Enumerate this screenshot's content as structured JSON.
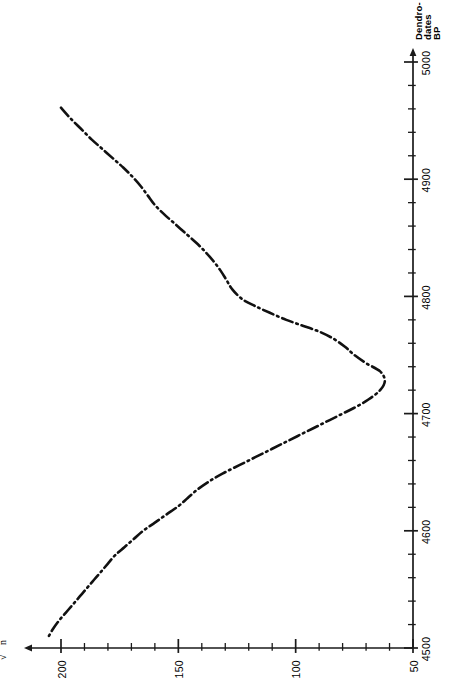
{
  "chart_data": {
    "type": "line",
    "title": "",
    "subtitle": "",
    "xlabel": "sqrt(sum sigma_i^2 / n)",
    "xlabel_display": "√(Σσᵢ²/n)",
    "ylabel": "Dendro-dates BP",
    "ylabel_lines": [
      "Dendro-",
      "dates",
      "BP"
    ],
    "x_axis": {
      "orientation": "horizontal",
      "direction": "reversed",
      "min": 50,
      "max": 210,
      "major_ticks": [
        200,
        150,
        100,
        50
      ],
      "major_tick_labels": [
        "200",
        "150",
        "100",
        "50"
      ],
      "minor_tick_step": 10,
      "arrow": "left",
      "grid": false
    },
    "y_axis": {
      "orientation": "vertical",
      "direction": "reversed-upward",
      "min": 4500,
      "max": 5030,
      "major_ticks": [
        4500,
        4600,
        4700,
        4800,
        4900,
        5000
      ],
      "major_tick_labels": [
        "4500",
        "4600",
        "4700",
        "4800",
        "4900",
        "5000"
      ],
      "minor_tick_step": 20,
      "arrow": "up",
      "grid": false
    },
    "series": [
      {
        "name": "standard deviation of calibration",
        "linestyle": "dash-dot",
        "color": "#111111",
        "linewidth": 2.6,
        "points": [
          {
            "x": 200.0,
            "y": 4961
          },
          {
            "x": 196.0,
            "y": 4952
          },
          {
            "x": 191.5,
            "y": 4943
          },
          {
            "x": 187.0,
            "y": 4934
          },
          {
            "x": 182.5,
            "y": 4926
          },
          {
            "x": 178.0,
            "y": 4918
          },
          {
            "x": 173.5,
            "y": 4910
          },
          {
            "x": 169.5,
            "y": 4902
          },
          {
            "x": 166.0,
            "y": 4894
          },
          {
            "x": 163.0,
            "y": 4886
          },
          {
            "x": 160.0,
            "y": 4878
          },
          {
            "x": 156.0,
            "y": 4870
          },
          {
            "x": 151.5,
            "y": 4862
          },
          {
            "x": 147.0,
            "y": 4854
          },
          {
            "x": 142.5,
            "y": 4846
          },
          {
            "x": 138.5,
            "y": 4838
          },
          {
            "x": 135.0,
            "y": 4830
          },
          {
            "x": 132.0,
            "y": 4822
          },
          {
            "x": 129.5,
            "y": 4814
          },
          {
            "x": 127.0,
            "y": 4806
          },
          {
            "x": 123.0,
            "y": 4798
          },
          {
            "x": 117.5,
            "y": 4792
          },
          {
            "x": 111.0,
            "y": 4786
          },
          {
            "x": 104.0,
            "y": 4780
          },
          {
            "x": 97.0,
            "y": 4775
          },
          {
            "x": 90.0,
            "y": 4770
          },
          {
            "x": 84.0,
            "y": 4764
          },
          {
            "x": 79.0,
            "y": 4757
          },
          {
            "x": 75.0,
            "y": 4750
          },
          {
            "x": 70.0,
            "y": 4743
          },
          {
            "x": 64.0,
            "y": 4736
          },
          {
            "x": 62.0,
            "y": 4728
          },
          {
            "x": 64.0,
            "y": 4720
          },
          {
            "x": 69.0,
            "y": 4712
          },
          {
            "x": 75.0,
            "y": 4705
          },
          {
            "x": 82.0,
            "y": 4698
          },
          {
            "x": 89.0,
            "y": 4691
          },
          {
            "x": 96.0,
            "y": 4684
          },
          {
            "x": 103.0,
            "y": 4677
          },
          {
            "x": 110.0,
            "y": 4670
          },
          {
            "x": 117.0,
            "y": 4663
          },
          {
            "x": 124.0,
            "y": 4656
          },
          {
            "x": 131.0,
            "y": 4649
          },
          {
            "x": 137.0,
            "y": 4642
          },
          {
            "x": 142.0,
            "y": 4635
          },
          {
            "x": 146.0,
            "y": 4628
          },
          {
            "x": 150.0,
            "y": 4621
          },
          {
            "x": 155.0,
            "y": 4614
          },
          {
            "x": 160.0,
            "y": 4607
          },
          {
            "x": 165.0,
            "y": 4600
          },
          {
            "x": 169.0,
            "y": 4593
          },
          {
            "x": 173.0,
            "y": 4586
          },
          {
            "x": 177.0,
            "y": 4579
          },
          {
            "x": 180.0,
            "y": 4572
          },
          {
            "x": 183.0,
            "y": 4565
          },
          {
            "x": 186.0,
            "y": 4558
          },
          {
            "x": 189.0,
            "y": 4551
          },
          {
            "x": 192.0,
            "y": 4544
          },
          {
            "x": 195.0,
            "y": 4537
          },
          {
            "x": 198.0,
            "y": 4530
          },
          {
            "x": 201.0,
            "y": 4523
          },
          {
            "x": 203.5,
            "y": 4516
          },
          {
            "x": 205.5,
            "y": 4509
          }
        ]
      }
    ],
    "annotations": [],
    "legend": {
      "visible": false,
      "position": "none"
    }
  },
  "axis_titles": {
    "x_formula": {
      "radical": "√",
      "numerator_sigma": "Σσ",
      "numerator_sub": "i",
      "numerator_sup": "2",
      "denominator": "n"
    },
    "y_title_line1": "Dendro-",
    "y_title_line2": "dates",
    "y_title_line3": "BP"
  },
  "colors": {
    "axis": "#1a1a1a",
    "curve": "#111111",
    "background": "#ffffff",
    "text": "#000000"
  }
}
